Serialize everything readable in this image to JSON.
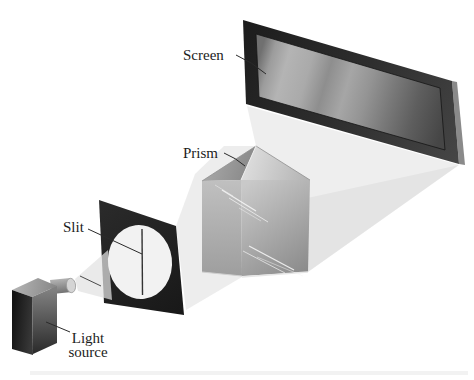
{
  "labels": {
    "screen": "Screen",
    "prism": "Prism",
    "slit": "Slit",
    "light_source_line1": "Light",
    "light_source_line2": "source"
  },
  "colors": {
    "background": "#ffffff",
    "label_text": "#1c1c1c",
    "pointer_line": "#2a2a2a",
    "beam": "#e9e9e9",
    "screen_frame_dark": "#1c1c1c",
    "screen_frame_light": "#464646",
    "screen_side_edge": "#8a8a8a",
    "spectrum_stops": [
      "#707070",
      "#b4b4b4",
      "#8e8e8e",
      "#a6a6a6",
      "#7a7a7a",
      "#464646"
    ],
    "slit_plate": "#1f1f1f",
    "slit_ellipse": "#eeeeee",
    "slit_line": "#333333",
    "prism_top_left": "#9b9b9b",
    "prism_top_right": "#cccccc",
    "prism_left_face": "#b0b0b0",
    "prism_right_face": "#a8a8a8",
    "prism_streak": "#f4f4f4",
    "source_front": "#1d1d1d",
    "source_top": "#a8a8a8",
    "source_side": "#565656",
    "nozzle": "#9a9a9a"
  }
}
